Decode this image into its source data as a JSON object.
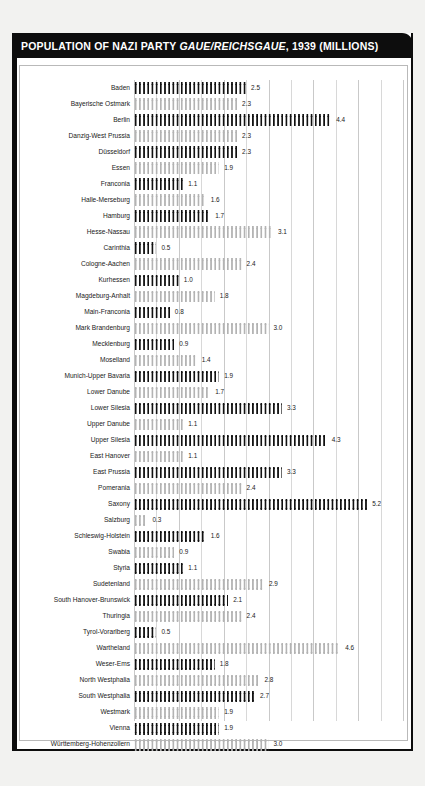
{
  "header": {
    "title_prefix": "POPULATION OF NAZI PARTY ",
    "title_italic": "GAUE/REICHSGAUE",
    "title_suffix": ", 1939 (MILLIONS)"
  },
  "colors": {
    "header_background": "#0d0d0d",
    "header_text": "#ffffff",
    "bar_dark": "#111111",
    "bar_light": "#b3b3b3",
    "gridline": "#d8d8d8",
    "page_background": "#f2f2f0",
    "plot_background": "#ffffff"
  },
  "chart_data": {
    "type": "bar",
    "orientation": "horizontal",
    "title": "POPULATION OF NAZI PARTY GAUE/REICHSGAUE, 1939 (MILLIONS)",
    "xlabel": "",
    "ylabel": "",
    "xlim": [
      0,
      6
    ],
    "grid": true,
    "gridline_interval": 0.5,
    "legend": false,
    "units": "millions",
    "categories": [
      "Baden",
      "Bayerische Ostmark",
      "Berlin",
      "Danzig-West Prussia",
      "Düsseldorf",
      "Essen",
      "Franconia",
      "Halle-Merseburg",
      "Hamburg",
      "Hesse-Nassau",
      "Carinthia",
      "Cologne-Aachen",
      "Kurhessen",
      "Magdeburg-Anhalt",
      "Main-Franconia",
      "Mark Brandenburg",
      "Mecklenburg",
      "Moselland",
      "Munich-Upper Bavaria",
      "Lower Danube",
      "Lower Silesia",
      "Upper Danube",
      "Upper Silesia",
      "East Hanover",
      "East Prussia",
      "Pomerania",
      "Saxony",
      "Salzburg",
      "Schleswig-Holstein",
      "Swabia",
      "Styria",
      "Sudetenland",
      "South Hanover-Brunswick",
      "Thuringia",
      "Tyrol-Vorarlberg",
      "Wartheland",
      "Weser-Ems",
      "North Westphalia",
      "South Westphalia",
      "Westmark",
      "Vienna",
      "Württemberg-Hohenzollern"
    ],
    "values": [
      2.5,
      2.3,
      4.4,
      2.3,
      2.3,
      1.9,
      1.1,
      1.6,
      1.7,
      3.1,
      0.5,
      2.4,
      1.0,
      1.8,
      0.8,
      3.0,
      0.9,
      1.4,
      1.9,
      1.7,
      3.3,
      1.1,
      4.3,
      1.1,
      3.3,
      2.4,
      5.2,
      0.3,
      1.6,
      0.9,
      1.1,
      2.9,
      2.1,
      2.4,
      0.5,
      4.6,
      1.8,
      2.8,
      2.7,
      1.9,
      1.9,
      3.0
    ],
    "value_labels": [
      "2.5",
      "2.3",
      "4.4",
      "2.3",
      "2.3",
      "1.9",
      "1.1",
      "1.6",
      "1.7",
      "3.1",
      "0.5",
      "2.4",
      "1.0",
      "1.8",
      "0.8",
      "3.0",
      "0.9",
      "1.4",
      "1.9",
      "1.7",
      "3.3",
      "1.1",
      "4.3",
      "1.1",
      "3.3",
      "2.4",
      "5.2",
      "0.3",
      "1.6",
      "0.9",
      "1.1",
      "2.9",
      "2.1",
      "2.4",
      "0.5",
      "4.6",
      "1.8",
      "2.8",
      "2.7",
      "1.9",
      "1.9",
      "3.0"
    ],
    "bar_styles": [
      "dark",
      "light",
      "dark",
      "light",
      "dark",
      "light",
      "dark",
      "light",
      "dark",
      "light",
      "dark",
      "light",
      "dark",
      "light",
      "dark",
      "light",
      "dark",
      "light",
      "dark",
      "light",
      "dark",
      "light",
      "dark",
      "light",
      "dark",
      "light",
      "dark",
      "light",
      "dark",
      "light",
      "dark",
      "light",
      "dark",
      "light",
      "dark",
      "light",
      "dark",
      "light",
      "dark",
      "light",
      "dark",
      "light"
    ]
  }
}
